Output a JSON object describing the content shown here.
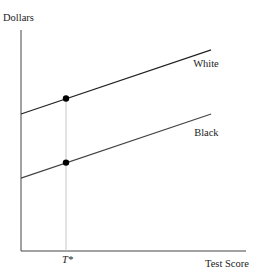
{
  "chart_data": {
    "type": "line",
    "title": "",
    "xlabel": "Test Score",
    "ylabel": "Dollars",
    "xlim": [
      0,
      10
    ],
    "ylim": [
      0,
      10
    ],
    "grid": false,
    "x_ticks": [
      {
        "value": 2,
        "label": "T*"
      }
    ],
    "series": [
      {
        "name": "White",
        "x": [
          0,
          8.45
        ],
        "y": [
          6.2,
          9.1
        ],
        "color": "#222222"
      },
      {
        "name": "Black",
        "x": [
          0,
          8.45
        ],
        "y": [
          3.3,
          6.2
        ],
        "color": "#444444"
      }
    ],
    "reference_line": {
      "x": 2,
      "label": "T*",
      "color": "#bbbbbb"
    },
    "markers": [
      {
        "series": "White",
        "x": 2,
        "y": 6.9
      },
      {
        "series": "Black",
        "x": 2,
        "y": 4.0
      }
    ],
    "annotations": [
      "White",
      "Black"
    ]
  }
}
